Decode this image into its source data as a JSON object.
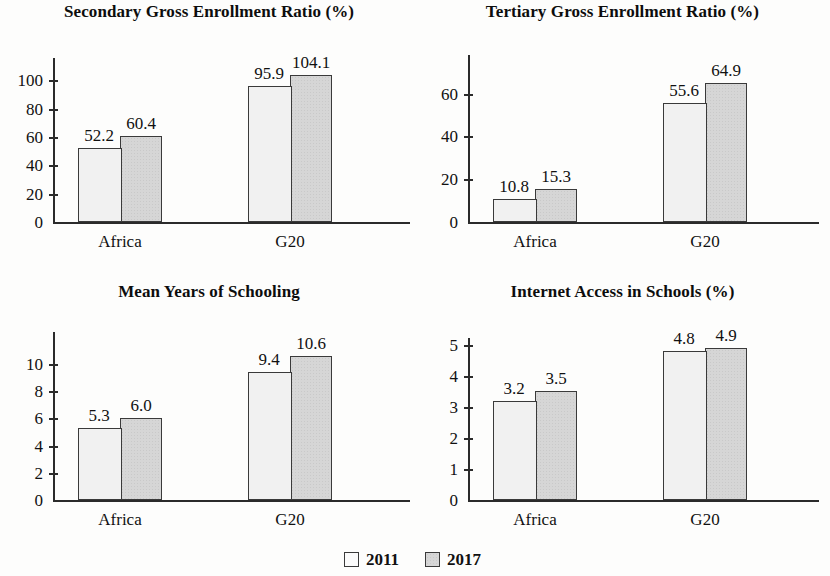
{
  "figure": {
    "group_labels": [
      "Africa",
      "G20"
    ],
    "legend": {
      "items": [
        {
          "label": "2011",
          "swatch": "white-square-swatch",
          "color": "#f1f1f1"
        },
        {
          "label": "2017",
          "swatch": "gray-square-swatch",
          "color": "#d6d6d6"
        }
      ]
    }
  },
  "chart_data": [
    {
      "type": "bar",
      "title": "Secondary Gross Enrollment Ratio (%)",
      "xlabel": "",
      "ylabel": "",
      "categories": [
        "Africa",
        "G20"
      ],
      "series": [
        {
          "name": "2011",
          "values": [
            52.2,
            95.9
          ]
        },
        {
          "name": "2017",
          "values": [
            60.4,
            104.1
          ]
        }
      ],
      "value_labels": [
        [
          "52.2",
          "95.9"
        ],
        [
          "60.4",
          "104.1"
        ]
      ],
      "yticks": [
        0,
        20,
        40,
        60,
        80,
        100
      ],
      "ytick_labels": [
        "0",
        "20",
        "40",
        "60",
        "80",
        "100"
      ],
      "ylim": [
        0,
        113
      ],
      "grid": false,
      "legend_position": "figure-bottom-center"
    },
    {
      "type": "bar",
      "title": "Tertiary Gross Enrollment Ratio (%)",
      "xlabel": "",
      "ylabel": "",
      "categories": [
        "Africa",
        "G20"
      ],
      "series": [
        {
          "name": "2011",
          "values": [
            10.8,
            55.6
          ]
        },
        {
          "name": "2017",
          "values": [
            15.3,
            64.9
          ]
        }
      ],
      "value_labels": [
        [
          "10.8",
          "55.6"
        ],
        [
          "15.3",
          "64.9"
        ]
      ],
      "yticks": [
        0,
        20,
        40,
        60
      ],
      "ytick_labels": [
        "0",
        "20",
        "40",
        "60"
      ],
      "ylim": [
        0,
        71
      ],
      "grid": false,
      "legend_position": "figure-bottom-center"
    },
    {
      "type": "bar",
      "title": "Mean Years of Schooling",
      "xlabel": "",
      "ylabel": "",
      "categories": [
        "Africa",
        "G20"
      ],
      "series": [
        {
          "name": "2011",
          "values": [
            5.3,
            9.4
          ]
        },
        {
          "name": "2017",
          "values": [
            6.0,
            10.6
          ]
        }
      ],
      "value_labels": [
        [
          "5.3",
          "9.4"
        ],
        [
          "6.0",
          "10.6"
        ]
      ],
      "yticks": [
        0,
        2,
        4,
        6,
        8,
        10
      ],
      "ytick_labels": [
        "0",
        "2",
        "4",
        "6",
        "8",
        "10"
      ],
      "ylim": [
        0,
        11.6
      ],
      "grid": false,
      "legend_position": "figure-bottom-center"
    },
    {
      "type": "bar",
      "title": "Internet Access in Schools (%)",
      "xlabel": "",
      "ylabel": "",
      "categories": [
        "Africa",
        "G20"
      ],
      "series": [
        {
          "name": "2011",
          "values": [
            3.2,
            4.8
          ]
        },
        {
          "name": "2017",
          "values": [
            3.5,
            4.9
          ]
        }
      ],
      "value_labels": [
        [
          "3.2",
          "4.8"
        ],
        [
          "3.5",
          "4.9"
        ]
      ],
      "yticks": [
        0,
        1,
        2,
        3,
        4,
        5
      ],
      "ytick_labels": [
        "0",
        "1",
        "2",
        "3",
        "4",
        "5"
      ],
      "ylim": [
        0,
        5.15
      ],
      "grid": false,
      "legend_position": "figure-bottom-center"
    }
  ]
}
